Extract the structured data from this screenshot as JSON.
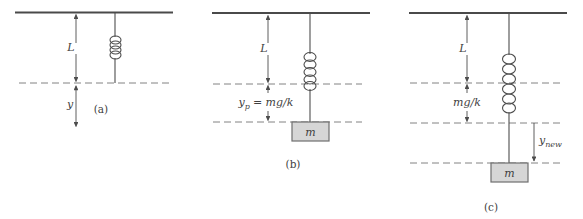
{
  "figure": {
    "colors": {
      "line": "#4d4d4d",
      "dashed_line": "#828282",
      "text": "#3f3f3f",
      "mass_fill": "#d6d6d6",
      "mass_border": "#6e6e6e",
      "background": "#ffffff"
    }
  },
  "panels": {
    "a": {
      "caption": "(a)",
      "natural_length_label": "L",
      "displacement_label": "y"
    },
    "b": {
      "caption": "(b)",
      "natural_length_label": "L",
      "equilibrium_main": "y",
      "equilibrium_sub": "p",
      "equilibrium_eq": "= mg/k",
      "mass_label": "m"
    },
    "c": {
      "caption": "(c)",
      "natural_length_label": "L",
      "stretch_label": "mg/k",
      "new_disp_main": "y",
      "new_disp_sub": "new",
      "mass_label": "m"
    }
  }
}
